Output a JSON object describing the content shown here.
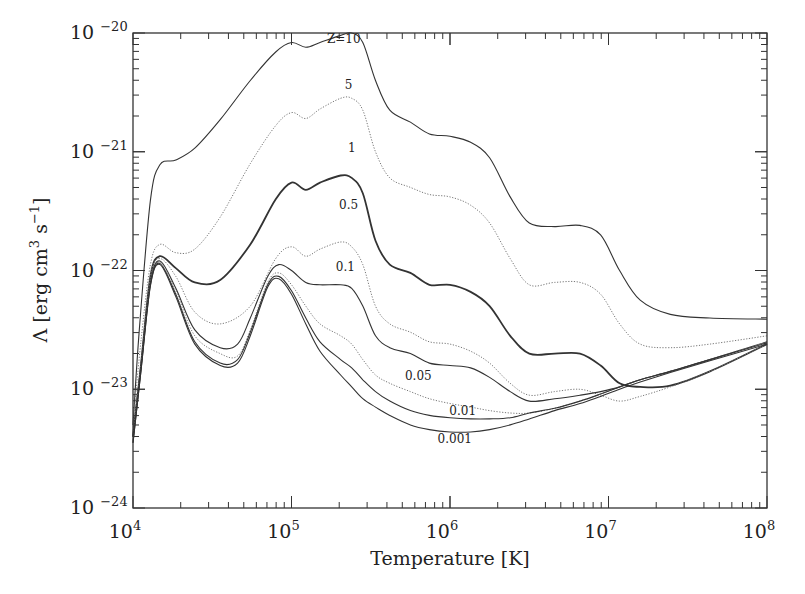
{
  "chart_data": {
    "type": "line",
    "title": "",
    "xlabel": "Temperature [K]",
    "ylabel": "Λ [erg cm³ s⁻¹]",
    "xscale": "log",
    "yscale": "log",
    "xlim": [
      10000,
      100000000
    ],
    "ylim": [
      1e-24,
      1e-20
    ],
    "grid": false,
    "legend": "inline curve labels",
    "x_ticks": [
      {
        "base": "10",
        "exp": "4",
        "log": 4
      },
      {
        "base": "10",
        "exp": "5",
        "log": 5
      },
      {
        "base": "10",
        "exp": "6",
        "log": 6
      },
      {
        "base": "10",
        "exp": "7",
        "log": 7
      },
      {
        "base": "10",
        "exp": "8",
        "log": 8
      }
    ],
    "y_ticks": [
      {
        "base": "10",
        "exp": "-20",
        "log": -20
      },
      {
        "base": "10",
        "exp": "-21",
        "log": -21
      },
      {
        "base": "10",
        "exp": "-22",
        "log": -22
      },
      {
        "base": "10",
        "exp": "-23",
        "log": -23
      },
      {
        "base": "10",
        "exp": "-24",
        "log": -24
      }
    ],
    "series_units": "points are [log10 T, log10 Λ]",
    "series": [
      {
        "name": "Z=10",
        "label": "Z=10",
        "style": "solid",
        "width": 1.1,
        "label_pos": [
          5.33,
          -20.08
        ],
        "points": [
          [
            4.0,
            -23.3
          ],
          [
            4.04,
            -22.5
          ],
          [
            4.11,
            -21.41
          ],
          [
            4.17,
            -21.11
          ],
          [
            4.27,
            -21.07
          ],
          [
            4.39,
            -20.97
          ],
          [
            4.55,
            -20.73
          ],
          [
            4.74,
            -20.4
          ],
          [
            4.9,
            -20.16
          ],
          [
            5.0,
            -20.08
          ],
          [
            5.09,
            -20.12
          ],
          [
            5.18,
            -20.08
          ],
          [
            5.31,
            -20.02
          ],
          [
            5.38,
            -20.0
          ],
          [
            5.45,
            -20.08
          ],
          [
            5.53,
            -20.4
          ],
          [
            5.62,
            -20.65
          ],
          [
            5.75,
            -20.75
          ],
          [
            5.87,
            -20.85
          ],
          [
            6.0,
            -20.87
          ],
          [
            6.13,
            -20.92
          ],
          [
            6.25,
            -21.05
          ],
          [
            6.38,
            -21.38
          ],
          [
            6.5,
            -21.6
          ],
          [
            6.66,
            -21.63
          ],
          [
            6.82,
            -21.62
          ],
          [
            6.95,
            -21.7
          ],
          [
            7.07,
            -22.0
          ],
          [
            7.2,
            -22.25
          ],
          [
            7.39,
            -22.37
          ],
          [
            7.64,
            -22.4
          ],
          [
            8.0,
            -22.41
          ]
        ]
      },
      {
        "name": "Z=5",
        "label": "5",
        "style": "dotted",
        "width": 1.0,
        "label_pos": [
          5.36,
          -20.47
        ],
        "points": [
          [
            4.0,
            -23.3
          ],
          [
            4.05,
            -22.6
          ],
          [
            4.11,
            -21.95
          ],
          [
            4.17,
            -21.78
          ],
          [
            4.27,
            -21.85
          ],
          [
            4.39,
            -21.82
          ],
          [
            4.55,
            -21.55
          ],
          [
            4.74,
            -21.1
          ],
          [
            4.9,
            -20.78
          ],
          [
            5.0,
            -20.67
          ],
          [
            5.09,
            -20.72
          ],
          [
            5.18,
            -20.64
          ],
          [
            5.31,
            -20.55
          ],
          [
            5.38,
            -20.55
          ],
          [
            5.45,
            -20.65
          ],
          [
            5.53,
            -21.0
          ],
          [
            5.62,
            -21.22
          ],
          [
            5.75,
            -21.3
          ],
          [
            5.87,
            -21.36
          ],
          [
            6.0,
            -21.38
          ],
          [
            6.13,
            -21.45
          ],
          [
            6.25,
            -21.6
          ],
          [
            6.38,
            -21.9
          ],
          [
            6.5,
            -22.12
          ],
          [
            6.66,
            -22.1
          ],
          [
            6.82,
            -22.1
          ],
          [
            6.95,
            -22.2
          ],
          [
            7.07,
            -22.45
          ],
          [
            7.2,
            -22.62
          ],
          [
            7.39,
            -22.65
          ],
          [
            7.64,
            -22.62
          ],
          [
            8.0,
            -22.55
          ]
        ]
      },
      {
        "name": "Z=1",
        "label": "1",
        "style": "solid",
        "width": 1.8,
        "label_pos": [
          5.38,
          -21.0
        ],
        "points": [
          [
            4.0,
            -23.4
          ],
          [
            4.05,
            -22.8
          ],
          [
            4.11,
            -22.05
          ],
          [
            4.17,
            -21.88
          ],
          [
            4.27,
            -21.98
          ],
          [
            4.39,
            -22.1
          ],
          [
            4.55,
            -22.08
          ],
          [
            4.74,
            -21.78
          ],
          [
            4.9,
            -21.4
          ],
          [
            5.0,
            -21.26
          ],
          [
            5.09,
            -21.32
          ],
          [
            5.18,
            -21.26
          ],
          [
            5.31,
            -21.2
          ],
          [
            5.38,
            -21.22
          ],
          [
            5.45,
            -21.35
          ],
          [
            5.53,
            -21.75
          ],
          [
            5.62,
            -21.95
          ],
          [
            5.75,
            -22.02
          ],
          [
            5.87,
            -22.12
          ],
          [
            6.0,
            -22.12
          ],
          [
            6.13,
            -22.18
          ],
          [
            6.25,
            -22.3
          ],
          [
            6.38,
            -22.55
          ],
          [
            6.5,
            -22.7
          ],
          [
            6.66,
            -22.7
          ],
          [
            6.82,
            -22.7
          ],
          [
            6.95,
            -22.8
          ],
          [
            7.07,
            -22.95
          ],
          [
            7.2,
            -22.98
          ],
          [
            7.39,
            -22.97
          ],
          [
            7.64,
            -22.85
          ],
          [
            8.0,
            -22.62
          ]
        ]
      },
      {
        "name": "Z=0.5",
        "label": "0.5",
        "style": "dotted",
        "width": 1.0,
        "label_pos": [
          5.36,
          -21.48
        ],
        "points": [
          [
            4.0,
            -23.4
          ],
          [
            4.05,
            -22.8
          ],
          [
            4.11,
            -22.05
          ],
          [
            4.17,
            -21.9
          ],
          [
            4.27,
            -22.05
          ],
          [
            4.39,
            -22.35
          ],
          [
            4.55,
            -22.45
          ],
          [
            4.74,
            -22.3
          ],
          [
            4.9,
            -21.9
          ],
          [
            5.0,
            -21.8
          ],
          [
            5.09,
            -21.88
          ],
          [
            5.18,
            -21.82
          ],
          [
            5.31,
            -21.76
          ],
          [
            5.38,
            -21.8
          ],
          [
            5.45,
            -21.95
          ],
          [
            5.53,
            -22.3
          ],
          [
            5.62,
            -22.45
          ],
          [
            5.75,
            -22.52
          ],
          [
            5.87,
            -22.6
          ],
          [
            6.0,
            -22.62
          ],
          [
            6.13,
            -22.68
          ],
          [
            6.25,
            -22.78
          ],
          [
            6.38,
            -22.95
          ],
          [
            6.5,
            -23.05
          ],
          [
            6.66,
            -23.02
          ],
          [
            6.82,
            -23.0
          ],
          [
            6.95,
            -23.05
          ],
          [
            7.07,
            -23.1
          ],
          [
            7.2,
            -23.06
          ],
          [
            7.39,
            -22.98
          ],
          [
            7.64,
            -22.85
          ],
          [
            8.0,
            -22.62
          ]
        ]
      },
      {
        "name": "Z=0.1",
        "label": "0.1",
        "style": "solid",
        "width": 1.1,
        "label_pos": [
          5.34,
          -22.0
        ],
        "points": [
          [
            4.0,
            -23.4
          ],
          [
            4.05,
            -22.8
          ],
          [
            4.11,
            -22.1
          ],
          [
            4.17,
            -21.92
          ],
          [
            4.27,
            -22.15
          ],
          [
            4.39,
            -22.5
          ],
          [
            4.55,
            -22.65
          ],
          [
            4.66,
            -22.62
          ],
          [
            4.74,
            -22.4
          ],
          [
            4.85,
            -22.05
          ],
          [
            4.92,
            -21.95
          ],
          [
            5.0,
            -22.0
          ],
          [
            5.09,
            -22.1
          ],
          [
            5.18,
            -22.12
          ],
          [
            5.31,
            -22.12
          ],
          [
            5.38,
            -22.15
          ],
          [
            5.45,
            -22.3
          ],
          [
            5.53,
            -22.55
          ],
          [
            5.62,
            -22.65
          ],
          [
            5.75,
            -22.7
          ],
          [
            5.87,
            -22.78
          ],
          [
            6.0,
            -22.8
          ],
          [
            6.13,
            -22.82
          ],
          [
            6.25,
            -22.9
          ],
          [
            6.38,
            -23.02
          ],
          [
            6.5,
            -23.1
          ],
          [
            6.66,
            -23.08
          ],
          [
            6.82,
            -23.05
          ],
          [
            6.95,
            -23.02
          ],
          [
            7.07,
            -22.98
          ],
          [
            7.2,
            -22.92
          ],
          [
            7.39,
            -22.85
          ],
          [
            7.64,
            -22.75
          ],
          [
            8.0,
            -22.6
          ]
        ]
      },
      {
        "name": "Z=0.05",
        "label": "0.05",
        "style": "dotted",
        "width": 1.0,
        "label_pos": [
          5.8,
          -22.92
        ],
        "points": [
          [
            4.0,
            -23.4
          ],
          [
            4.05,
            -22.8
          ],
          [
            4.11,
            -22.1
          ],
          [
            4.17,
            -21.93
          ],
          [
            4.27,
            -22.17
          ],
          [
            4.39,
            -22.55
          ],
          [
            4.55,
            -22.7
          ],
          [
            4.66,
            -22.72
          ],
          [
            4.74,
            -22.5
          ],
          [
            4.85,
            -22.1
          ],
          [
            4.92,
            -22.02
          ],
          [
            5.0,
            -22.12
          ],
          [
            5.09,
            -22.3
          ],
          [
            5.18,
            -22.45
          ],
          [
            5.31,
            -22.55
          ],
          [
            5.38,
            -22.62
          ],
          [
            5.45,
            -22.75
          ],
          [
            5.53,
            -22.88
          ],
          [
            5.62,
            -22.95
          ],
          [
            5.75,
            -23.02
          ],
          [
            5.87,
            -23.08
          ],
          [
            6.0,
            -23.12
          ],
          [
            6.13,
            -23.15
          ],
          [
            6.25,
            -23.18
          ],
          [
            6.38,
            -23.2
          ],
          [
            6.5,
            -23.2
          ],
          [
            6.66,
            -23.16
          ],
          [
            6.82,
            -23.1
          ],
          [
            6.95,
            -23.04
          ],
          [
            7.07,
            -22.98
          ],
          [
            7.2,
            -22.92
          ],
          [
            7.39,
            -22.85
          ],
          [
            7.64,
            -22.75
          ],
          [
            8.0,
            -22.6
          ]
        ]
      },
      {
        "name": "Z=0.01",
        "label": "0.01",
        "style": "solid",
        "width": 1.1,
        "label_pos": [
          6.08,
          -23.22
        ],
        "points": [
          [
            4.0,
            -23.45
          ],
          [
            4.05,
            -22.85
          ],
          [
            4.11,
            -22.12
          ],
          [
            4.17,
            -21.94
          ],
          [
            4.27,
            -22.2
          ],
          [
            4.39,
            -22.6
          ],
          [
            4.55,
            -22.78
          ],
          [
            4.66,
            -22.75
          ],
          [
            4.74,
            -22.52
          ],
          [
            4.85,
            -22.12
          ],
          [
            4.92,
            -22.05
          ],
          [
            5.0,
            -22.17
          ],
          [
            5.09,
            -22.4
          ],
          [
            5.18,
            -22.6
          ],
          [
            5.31,
            -22.75
          ],
          [
            5.38,
            -22.82
          ],
          [
            5.45,
            -22.92
          ],
          [
            5.53,
            -23.02
          ],
          [
            5.62,
            -23.1
          ],
          [
            5.75,
            -23.18
          ],
          [
            5.87,
            -23.22
          ],
          [
            6.0,
            -23.24
          ],
          [
            6.13,
            -23.25
          ],
          [
            6.25,
            -23.25
          ],
          [
            6.38,
            -23.24
          ],
          [
            6.5,
            -23.2
          ],
          [
            6.66,
            -23.16
          ],
          [
            6.82,
            -23.1
          ],
          [
            6.95,
            -23.04
          ],
          [
            7.07,
            -22.98
          ],
          [
            7.2,
            -22.92
          ],
          [
            7.39,
            -22.85
          ],
          [
            7.64,
            -22.75
          ],
          [
            8.0,
            -22.61
          ]
        ]
      },
      {
        "name": "Z=0.001",
        "label": "0.001",
        "style": "solid",
        "width": 1.1,
        "label_pos": [
          6.03,
          -23.45
        ],
        "points": [
          [
            4.0,
            -23.45
          ],
          [
            4.05,
            -22.85
          ],
          [
            4.11,
            -22.13
          ],
          [
            4.17,
            -21.95
          ],
          [
            4.27,
            -22.22
          ],
          [
            4.39,
            -22.62
          ],
          [
            4.55,
            -22.8
          ],
          [
            4.66,
            -22.78
          ],
          [
            4.74,
            -22.55
          ],
          [
            4.85,
            -22.14
          ],
          [
            4.92,
            -22.07
          ],
          [
            5.0,
            -22.2
          ],
          [
            5.09,
            -22.45
          ],
          [
            5.18,
            -22.68
          ],
          [
            5.31,
            -22.88
          ],
          [
            5.38,
            -22.98
          ],
          [
            5.45,
            -23.08
          ],
          [
            5.53,
            -23.15
          ],
          [
            5.62,
            -23.22
          ],
          [
            5.75,
            -23.3
          ],
          [
            5.87,
            -23.34
          ],
          [
            6.0,
            -23.36
          ],
          [
            6.13,
            -23.36
          ],
          [
            6.25,
            -23.34
          ],
          [
            6.38,
            -23.3
          ],
          [
            6.5,
            -23.25
          ],
          [
            6.66,
            -23.18
          ],
          [
            6.82,
            -23.12
          ],
          [
            6.95,
            -23.06
          ],
          [
            7.07,
            -23.0
          ],
          [
            7.2,
            -22.94
          ],
          [
            7.39,
            -22.86
          ],
          [
            7.64,
            -22.76
          ],
          [
            8.0,
            -22.62
          ]
        ]
      }
    ]
  }
}
